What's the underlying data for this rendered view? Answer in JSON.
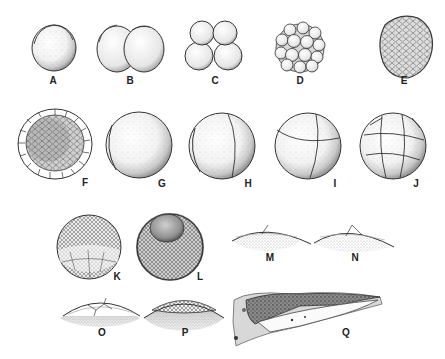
{
  "figure": {
    "background": "#ffffff",
    "ink_color": "#222222",
    "stages": [
      {
        "id": "A",
        "label": "A",
        "label_pos": [
          53,
          80
        ]
      },
      {
        "id": "B",
        "label": "B",
        "label_pos": [
          130,
          80
        ]
      },
      {
        "id": "C",
        "label": "C",
        "label_pos": [
          215,
          80
        ]
      },
      {
        "id": "D",
        "label": "D",
        "label_pos": [
          300,
          80
        ]
      },
      {
        "id": "E",
        "label": "E",
        "label_pos": [
          404,
          80
        ]
      },
      {
        "id": "F",
        "label": "F",
        "label_pos": [
          85,
          183
        ]
      },
      {
        "id": "G",
        "label": "G",
        "label_pos": [
          162,
          184
        ]
      },
      {
        "id": "H",
        "label": "H",
        "label_pos": [
          248,
          184
        ]
      },
      {
        "id": "I",
        "label": "I",
        "label_pos": [
          335,
          184
        ]
      },
      {
        "id": "J",
        "label": "J",
        "label_pos": [
          416,
          184
        ]
      },
      {
        "id": "K",
        "label": "K",
        "label_pos": [
          117,
          277
        ]
      },
      {
        "id": "L",
        "label": "L",
        "label_pos": [
          200,
          277
        ]
      },
      {
        "id": "M",
        "label": "M",
        "label_pos": [
          270,
          258
        ]
      },
      {
        "id": "N",
        "label": "N",
        "label_pos": [
          355,
          258
        ]
      },
      {
        "id": "O",
        "label": "O",
        "label_pos": [
          102,
          333
        ]
      },
      {
        "id": "P",
        "label": "P",
        "label_pos": [
          185,
          333
        ]
      },
      {
        "id": "Q",
        "label": "Q",
        "label_pos": [
          346,
          333
        ]
      }
    ]
  }
}
